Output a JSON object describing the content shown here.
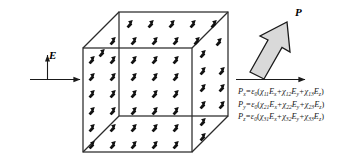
{
  "figure": {
    "background_color": "#ffffff",
    "line_color": "#1a1a1a",
    "arrow_fill_color": "#d9d9d9"
  },
  "field_label": {
    "text": "E",
    "description": "applied electric field label"
  },
  "polarization_label": {
    "text": "P",
    "description": "polarization vector label"
  },
  "cube": {
    "description": "wireframe cube in oblique projection filled with dipole arrows",
    "dipole_arrow_direction": "up-right",
    "front_face_rows": 6,
    "front_face_cols": 5,
    "top_face_rows": 2,
    "side_face_cols": 2
  },
  "equations": [
    {
      "lhs_symbol": "P",
      "lhs_sub": "x",
      "eps": "ε",
      "eps_sub": "0",
      "terms": [
        {
          "chi_sub": "11",
          "field_sub": "x"
        },
        {
          "chi_sub": "12",
          "field_sub": "y"
        },
        {
          "chi_sub": "13",
          "field_sub": "z"
        }
      ]
    },
    {
      "lhs_symbol": "P",
      "lhs_sub": "y",
      "eps": "ε",
      "eps_sub": "0",
      "terms": [
        {
          "chi_sub": "21",
          "field_sub": "x"
        },
        {
          "chi_sub": "22",
          "field_sub": "y"
        },
        {
          "chi_sub": "23",
          "field_sub": "z"
        }
      ]
    },
    {
      "lhs_symbol": "P",
      "lhs_sub": "z",
      "eps": "ε",
      "eps_sub": "0",
      "terms": [
        {
          "chi_sub": "31",
          "field_sub": "x"
        },
        {
          "chi_sub": "32",
          "field_sub": "y"
        },
        {
          "chi_sub": "33",
          "field_sub": "z"
        }
      ]
    }
  ],
  "equation_text": {
    "line1": "Px = ε0( χ11Ex + χ12Ey + χ13Ez )",
    "line2": "Py = ε0( χ21Ex + χ22Ey + χ23Ez )",
    "line3": "Pz = ε0( χ31Ex + χ32Ey + χ33Ez )"
  },
  "symbols": {
    "chi": "χ",
    "epsilon": "ε",
    "equals": "=",
    "plus": "+",
    "paren_open": "(",
    "paren_close": ")"
  }
}
